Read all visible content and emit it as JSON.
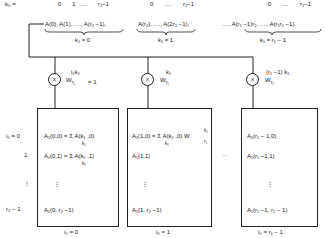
{
  "k0_row": {
    "label": "k₀ =",
    "groups": [
      {
        "start": "0",
        "second": "1",
        "dots": "....",
        "end": "r₂−1"
      },
      {
        "start": "0",
        "dots": "....",
        "end": "r₂−1"
      },
      {
        "start": "0",
        "dots": "....",
        "end": "r₂−1"
      }
    ]
  },
  "groups": [
    {
      "content": "A(0), A(1), ...., A(r₂ −1),",
      "label": "k₁ = 0"
    },
    {
      "content": "A(r₂), ...., A(2r₂ −1),",
      "label": "k₁ = 1"
    },
    {
      "content": "...., A(r₁ −1)r₂, ...., A(r₁r₂ −1)",
      "label": "k₁ = r₁ − 1"
    }
  ],
  "multipliers": [
    {
      "symbol": "x",
      "exponent": "i₀k₁",
      "twiddle": "W",
      "twiddle_sub": "r₁",
      "suffix": "= 1"
    },
    {
      "symbol": "x",
      "exponent": "k₁",
      "twiddle": "W",
      "twiddle_sub": "r₁",
      "suffix": ""
    },
    {
      "symbol": "x",
      "exponent": "(r₁ −1) k₁",
      "twiddle": "W",
      "twiddle_sub": "r₁",
      "suffix": ""
    }
  ],
  "row_labels": [
    "i₀ = 0",
    "1",
    "⋮",
    "r₂ − 1"
  ],
  "boxes": [
    {
      "rows": [
        "A₁(0,0) = Σ A(k₁ ,0)",
        "A₁(0,1) = Σ A(k₁ ,1)",
        "⋮",
        "A₁(0, r₂ −1)"
      ],
      "sum_sub": "k₁",
      "footer": "i₀ = 0"
    },
    {
      "rows": [
        "A₁(1,0) = Σ A(k₁ ,0) W",
        "A₁(1,1)",
        "⋮",
        "A₁(1, r₂ −1)"
      ],
      "sum_sub": "k₁",
      "w_sup": "k₁",
      "w_sub": "r₁",
      "footer": "i₀ = 1"
    },
    {
      "rows": [
        "A₁(r₁ − 1,0)",
        "A₁(r₁ −1,1)",
        "⋮",
        "A₁(r₁ −1, r₂ − 1)"
      ],
      "footer": "i₀ = r₁ − 1"
    }
  ],
  "between_dots": "···"
}
